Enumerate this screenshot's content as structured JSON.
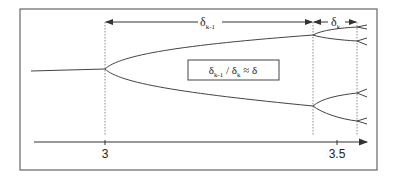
{
  "diagram": {
    "axis": {
      "ticks": [
        {
          "label": "3",
          "x": 105
        },
        {
          "label": "3.5",
          "x": 337
        }
      ]
    },
    "intervals": {
      "delta_k_minus_1": {
        "symbol": "δ",
        "subscript": "k-1"
      },
      "delta_k": {
        "symbol": "δ",
        "subscript": "k"
      }
    },
    "ratio_box": {
      "num_symbol": "δ",
      "num_sub": "k-1",
      "slash": " / ",
      "den_symbol": "δ",
      "den_sub": "k",
      "approx": " ≈ δ"
    },
    "colors": {
      "line": "#444444",
      "frame": "#666666",
      "dotted": "#888888",
      "text": "#222222"
    }
  }
}
